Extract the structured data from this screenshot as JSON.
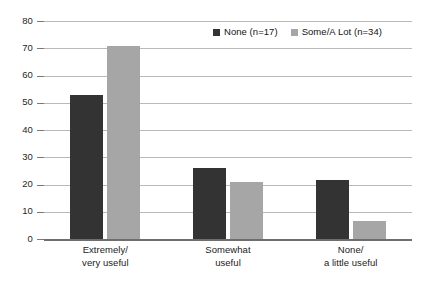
{
  "chart_data": {
    "type": "bar",
    "title": "",
    "subtitle": "",
    "xlabel": "",
    "ylabel": "",
    "ylim": [
      0,
      80
    ],
    "yticks": [
      0,
      10,
      20,
      30,
      40,
      50,
      60,
      70,
      80
    ],
    "ytick_labels": [
      "0",
      "10",
      "20",
      "30",
      "40",
      "50",
      "60",
      "70",
      "80"
    ],
    "grid": true,
    "legend_position": "top-right",
    "categories": [
      {
        "line1": "Extremely/",
        "line2": "very useful"
      },
      {
        "line1": "Somewhat",
        "line2": "useful"
      },
      {
        "line1": "None/",
        "line2": "a little useful"
      }
    ],
    "category_labels": [
      "Extremely/very useful",
      "Somewhat useful",
      "None/a little useful"
    ],
    "series": [
      {
        "name": "None (n=17)",
        "color": "#333333",
        "values": [
          53,
          26,
          21.5
        ]
      },
      {
        "name": "Some/A Lot (n=34)",
        "color": "#a6a6a6",
        "values": [
          71,
          21,
          6.5
        ]
      }
    ]
  },
  "axis": {
    "gridline_color": "#b9b9b9",
    "zero_line_color": "#6e6e6e"
  }
}
